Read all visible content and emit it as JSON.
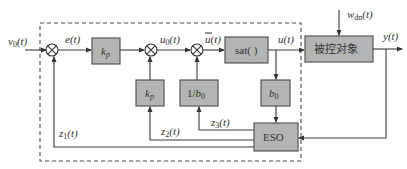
{
  "diagram": {
    "type": "control-block-diagram",
    "signals": {
      "input": "v0(t)",
      "error": "e(t)",
      "u0": "u0(t)",
      "ubar": "ū(t)",
      "u": "u(t)",
      "disturbance": "wdn(t)",
      "output": "y(t)",
      "z1": "z1(t)",
      "z2": "z2(t)",
      "z3": "z3(t)"
    },
    "blocks": {
      "kp_forward": "kp",
      "sat": "sat( )",
      "plant": "被控对象",
      "kp_feedback": "kp",
      "inv_b0": "1/b0",
      "b0": "b0",
      "eso": "ESO"
    },
    "colors": {
      "block_fill": "#b4b4b4",
      "line": "#3a3a3a"
    }
  }
}
